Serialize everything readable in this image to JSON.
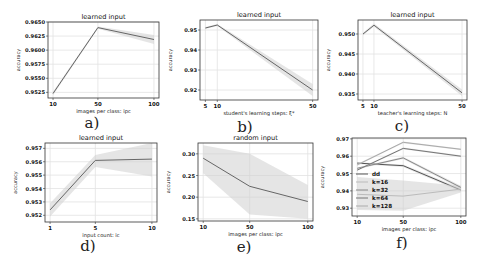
{
  "figure": {
    "subplot_labels": [
      "a)",
      "b)",
      "c)",
      "d)",
      "e)",
      "f)"
    ]
  },
  "chart_data": [
    {
      "id": "a",
      "type": "line",
      "title": "learned input",
      "xlabel": "images per class: ipc",
      "ylabel": "accuracy",
      "x": [
        10,
        50,
        100
      ],
      "xticks": [
        "10",
        "50",
        "100"
      ],
      "ylim": [
        0.9515,
        0.965
      ],
      "yticks": [
        0.9525,
        0.955,
        0.9575,
        0.96,
        0.9625,
        0.965
      ],
      "ytick_labels": [
        "0.9525",
        "0.9550",
        "0.9575",
        "0.9600",
        "0.9625",
        "0.9650"
      ],
      "grid": true,
      "series": [
        {
          "name": "learned input",
          "values": [
            0.9523,
            0.964,
            0.9619
          ],
          "band_low": [
            0.952,
            0.9638,
            0.9611
          ],
          "band_high": [
            0.9526,
            0.9642,
            0.9627
          ]
        }
      ]
    },
    {
      "id": "b",
      "type": "line",
      "title": "learned input",
      "xlabel": "student's learning steps: ξ*",
      "ylabel": "accuracy",
      "x": [
        5,
        10,
        50
      ],
      "xticks": [
        "5",
        "10",
        "50"
      ],
      "ylim": [
        0.915,
        0.955
      ],
      "yticks": [
        0.92,
        0.93,
        0.94,
        0.95
      ],
      "ytick_labels": [
        "0.92",
        "0.93",
        "0.94",
        "0.95"
      ],
      "grid": true,
      "series": [
        {
          "name": "learned input",
          "values": [
            0.951,
            0.9525,
            0.92
          ],
          "band_low": [
            0.9505,
            0.952,
            0.917
          ],
          "band_high": [
            0.9515,
            0.953,
            0.923
          ]
        }
      ]
    },
    {
      "id": "c",
      "type": "line",
      "title": "learned input",
      "xlabel": "teacher's learning steps: N",
      "ylabel": "accuracy",
      "x": [
        5,
        10,
        50
      ],
      "xticks": [
        "5",
        "10",
        "50"
      ],
      "ylim": [
        0.9335,
        0.9535
      ],
      "yticks": [
        0.935,
        0.94,
        0.945,
        0.95
      ],
      "ytick_labels": [
        "0.935",
        "0.940",
        "0.945",
        "0.950"
      ],
      "grid": true,
      "series": [
        {
          "name": "learned input",
          "values": [
            0.95,
            0.9522,
            0.9353
          ],
          "band_low": [
            0.9497,
            0.9518,
            0.9345
          ],
          "band_high": [
            0.9503,
            0.9526,
            0.9361
          ]
        }
      ]
    },
    {
      "id": "d",
      "type": "line",
      "title": "learned input",
      "xlabel": "input count: ic",
      "ylabel": "accuracy",
      "x": [
        1,
        5,
        10
      ],
      "xticks": [
        "1",
        "5",
        "10"
      ],
      "ylim": [
        0.9515,
        0.9574
      ],
      "yticks": [
        0.952,
        0.953,
        0.954,
        0.955,
        0.956,
        0.957
      ],
      "ytick_labels": [
        "0.952",
        "0.953",
        "0.954",
        "0.955",
        "0.956",
        "0.957"
      ],
      "grid": true,
      "series": [
        {
          "name": "learned input",
          "values": [
            0.9524,
            0.9561,
            0.9562
          ],
          "band_low": [
            0.9519,
            0.9556,
            0.9549
          ],
          "band_high": [
            0.9529,
            0.9565,
            0.9574
          ]
        }
      ]
    },
    {
      "id": "e",
      "type": "line",
      "title": "random input",
      "xlabel": "images per class: ipc",
      "ylabel": "accuracy",
      "x": [
        10,
        50,
        100
      ],
      "xticks": [
        "10",
        "50",
        "100"
      ],
      "ylim": [
        0.145,
        0.325
      ],
      "yticks": [
        0.15,
        0.2,
        0.25,
        0.3
      ],
      "ytick_labels": [
        "0.15",
        "0.20",
        "0.25",
        "0.30"
      ],
      "grid": true,
      "series": [
        {
          "name": "random input",
          "values": [
            0.29,
            0.225,
            0.19
          ],
          "band_low": [
            0.255,
            0.16,
            0.15
          ],
          "band_high": [
            0.32,
            0.3,
            0.228
          ]
        }
      ]
    },
    {
      "id": "f",
      "type": "line",
      "title": "",
      "xlabel": "images per class: ipc",
      "ylabel": "accuracy",
      "x": [
        10,
        50,
        100
      ],
      "xticks": [
        "10",
        "50",
        "100"
      ],
      "ylim": [
        0.9255,
        0.9705
      ],
      "yticks": [
        0.93,
        0.94,
        0.95,
        0.96,
        0.97
      ],
      "ytick_labels": [
        "0.93",
        "0.94",
        "0.95",
        "0.96",
        "0.97"
      ],
      "grid": true,
      "legend_position": "lower left",
      "series": [
        {
          "name": "dd",
          "values": [
            0.956,
            0.9545,
            0.9405
          ],
          "band_low": [
            0.9555,
            0.9538,
            0.9395
          ],
          "band_high": [
            0.9565,
            0.9552,
            0.9415
          ],
          "color": "#555555"
        },
        {
          "name": "k=16",
          "values": [
            0.938,
            0.937,
            0.941
          ],
          "band_low": [
            0.929,
            0.9285,
            0.939
          ],
          "band_high": [
            0.948,
            0.946,
            0.943
          ],
          "color": "#bbbbbb"
        },
        {
          "name": "k=32",
          "values": [
            0.953,
            0.959,
            0.942
          ],
          "band_low": [
            0.9525,
            0.9583,
            0.941
          ],
          "band_high": [
            0.9535,
            0.9597,
            0.943
          ],
          "color": "#888888"
        },
        {
          "name": "k=64",
          "values": [
            0.952,
            0.9645,
            0.96
          ],
          "band_low": [
            0.9515,
            0.964,
            0.9595
          ],
          "band_high": [
            0.9525,
            0.965,
            0.9605
          ],
          "color": "#777777"
        },
        {
          "name": "k=128",
          "values": [
            0.955,
            0.968,
            0.964
          ],
          "band_low": [
            0.9545,
            0.9675,
            0.9635
          ],
          "band_high": [
            0.9555,
            0.9685,
            0.9645
          ],
          "color": "#aaaaaa"
        }
      ]
    }
  ]
}
